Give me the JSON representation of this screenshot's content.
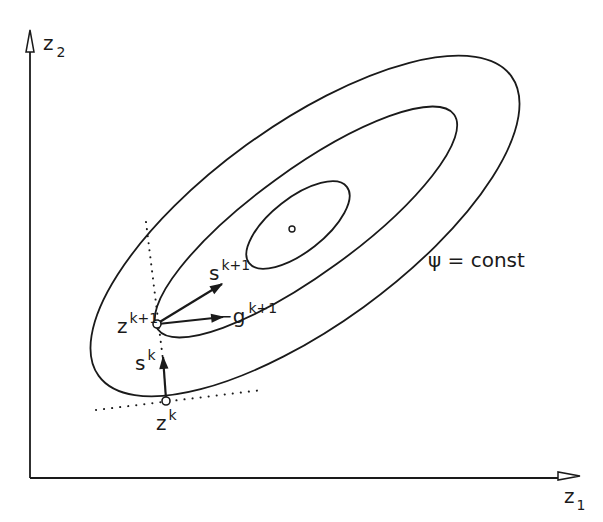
{
  "axes": {
    "x_label": "z",
    "x_sub": "1",
    "y_label": "z",
    "y_sub": "2"
  },
  "contour_label": "ψ = const",
  "points": {
    "zk": {
      "base": "z",
      "sup": "k"
    },
    "zk1": {
      "base": "z",
      "sup": "k+1"
    }
  },
  "vectors": {
    "sk": {
      "base": "s",
      "sup": "k"
    },
    "sk1": {
      "base": "s",
      "sup": "k+1"
    },
    "gk1": {
      "base": "−g",
      "sup": "k+1"
    }
  },
  "colors": {
    "ink": "#1a1a1a",
    "background": "#ffffff"
  }
}
